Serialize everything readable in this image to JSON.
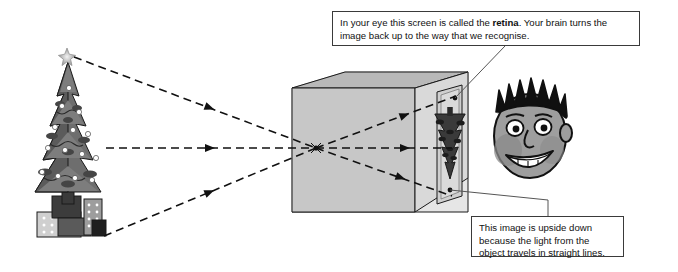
{
  "figure": {
    "background_color": "#ffffff",
    "line_color": "#1a1a1a"
  },
  "callouts": [
    {
      "name": "retina-callout",
      "text_before": "In your eye this screen is called the ",
      "emphasis": "retina",
      "text_after": ". Your brain turns the image back up to the way that we recognise."
    },
    {
      "name": "upside-down-callout",
      "line1": "This image is upside down",
      "line2": "because the light from the",
      "line3": "object travels in straight lines."
    }
  ],
  "objects": {
    "tree": {
      "label": "christmas-tree",
      "star_label": "star-topper",
      "presents_label": "presents"
    },
    "box": {
      "label": "pinhole-box",
      "pinhole_label": "pinhole-aperture",
      "screen_label": "rear-screen",
      "projected_image_label": "inverted-tree-image"
    },
    "face": {
      "label": "observer-face"
    }
  },
  "rays": [
    {
      "name": "ray-top",
      "from": "tree-star",
      "to": "screen-bottom"
    },
    {
      "name": "ray-middle",
      "from": "tree-middle",
      "to": "screen-middle"
    },
    {
      "name": "ray-bottom",
      "from": "tree-presents",
      "to": "screen-top"
    }
  ],
  "colors": {
    "box_top_face": "#b5b5b5",
    "box_left_face": "#c9c9c9",
    "box_interior": "#dcdcdc",
    "box_floor": "#e2e2e2",
    "screen_panel": "#d2d2d2",
    "tree_dark": "#4a4a4a",
    "tree_mid": "#6e6e6e",
    "tree_light": "#8c8c8c",
    "hair": "#111111",
    "skin": "#9a9a9a",
    "outline": "#1a1a1a"
  }
}
